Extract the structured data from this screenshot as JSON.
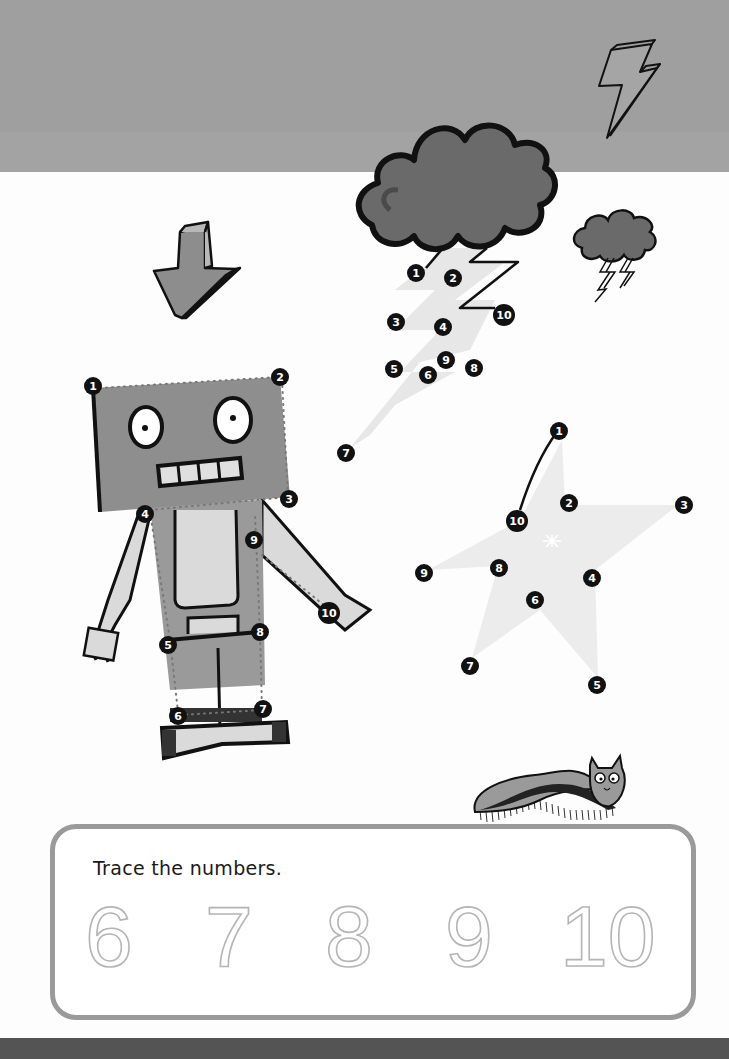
{
  "page": {
    "background": "#fdfdfd",
    "top_band_color": "#9f9f9f",
    "bottom_band_color": "#545454"
  },
  "decorations": {
    "lightning_top_right": "lightning-bolt-outline",
    "big_cloud": "storm-cloud",
    "small_cloud": "storm-cloud-with-bolts",
    "arrow": "down-arrow",
    "critter": "caterpillar-cat"
  },
  "puzzles": {
    "lightning": {
      "label": "lightning-bolt-dot-to-dot",
      "dots": [
        "1",
        "2",
        "3",
        "4",
        "5",
        "6",
        "7",
        "8",
        "9",
        "10"
      ]
    },
    "robot": {
      "label": "robot-dot-to-dot",
      "dots": [
        "1",
        "2",
        "3",
        "4",
        "5",
        "6",
        "7",
        "8",
        "9",
        "10"
      ]
    },
    "star": {
      "label": "star-dot-to-dot",
      "dots": [
        "1",
        "2",
        "3",
        "4",
        "5",
        "6",
        "7",
        "8",
        "9",
        "10"
      ]
    }
  },
  "trace": {
    "title": "Trace the numbers.",
    "digits": [
      "6",
      "7",
      "8",
      "9",
      "10"
    ]
  }
}
